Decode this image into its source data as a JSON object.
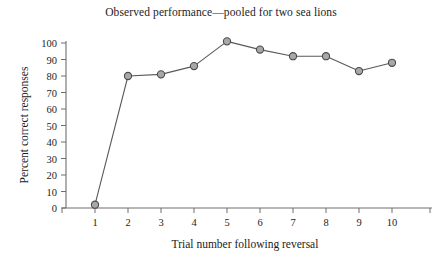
{
  "chart_data": {
    "type": "line",
    "title": "Observed performance—pooled for two sea lions",
    "xlabel": "Trial number following reversal",
    "ylabel": "Percent correct responses",
    "x": [
      1,
      2,
      3,
      4,
      5,
      6,
      7,
      8,
      9,
      10
    ],
    "values": [
      2,
      80,
      81,
      86,
      101,
      96,
      92,
      92,
      83,
      88
    ],
    "xticks": [
      "1",
      "2",
      "3",
      "4",
      "5",
      "6",
      "7",
      "8",
      "9",
      "10"
    ],
    "yticks": [
      "0",
      "10",
      "20",
      "30",
      "40",
      "50",
      "60",
      "70",
      "80",
      "90",
      "100"
    ],
    "xlim": [
      0.5,
      11.0
    ],
    "ylim": [
      0,
      100
    ],
    "grid": false,
    "legend": null,
    "marker": "circle",
    "marker_fill": "#a8a8a8",
    "marker_edge": "#4a4a4a",
    "line_color": "#5a5a5a",
    "axis_color": "#6e6e6e",
    "background": "#ffffff"
  }
}
